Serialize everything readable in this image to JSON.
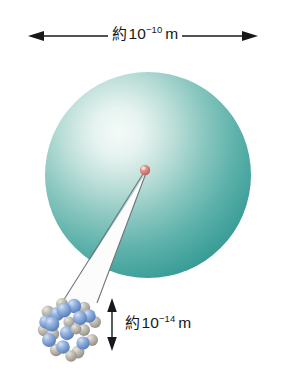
{
  "figure": {
    "type": "scale-diagram",
    "background_color": "#ffffff"
  },
  "annotations": {
    "atom_size": {
      "prefix": "約",
      "mantissa": "10",
      "exponent": "−10",
      "unit": "m",
      "full_text": "約 10⁻¹⁰ m",
      "measures": "atom-diameter",
      "arrow": "double-headed-horizontal"
    },
    "nucleus_size": {
      "prefix": "約",
      "mantissa": "10",
      "exponent": "−14",
      "unit": "m",
      "full_text": "約 10⁻¹⁴ m",
      "measures": "nucleus-diameter",
      "arrow": "double-headed-vertical"
    }
  },
  "shapes": {
    "electron_cloud": {
      "name": "electron-cloud-sphere",
      "center_x": 148,
      "center_y": 175,
      "radius": 103,
      "edge_color": "#2f918d",
      "mid_color": "#5fb4ae",
      "highlight_color": "#eef7f5",
      "highlight_x": 105,
      "highlight_y": 118
    },
    "nucleus_point": {
      "name": "nucleus-point",
      "center_x": 145,
      "center_y": 170,
      "radius": 5,
      "color": "#cf7671",
      "highlight_color": "#f2c4bd"
    },
    "magnifier_cone": {
      "name": "magnification-cone",
      "fill": "#fbfbfb",
      "stroke": "#6e7276",
      "apex_x": 145,
      "apex_y": 172,
      "base_left_x": 52,
      "base_left_y": 316,
      "base_right_x": 96,
      "base_right_y": 304
    },
    "nucleon_cluster": {
      "name": "nucleon-cluster",
      "center_x": 70,
      "center_y": 325,
      "radius": 30,
      "proton_color": "#7fa0d6",
      "proton_highlight": "#c3d4ee",
      "proton_shadow": "#5878ae",
      "neutron_color": "#b9b4ab",
      "neutron_highlight": "#e0dcd4",
      "neutron_shadow": "#8d887f",
      "nucleon_count": 24
    },
    "arrow_horizontal": {
      "name": "atom-size-arrow",
      "x1": 30,
      "x2": 256,
      "y": 36,
      "color": "#16181a"
    },
    "arrow_vertical": {
      "name": "nucleus-size-arrow",
      "x": 112,
      "y1": 299,
      "y2": 350,
      "color": "#16181a"
    }
  },
  "colors": {
    "teal_edge": "#2f918d",
    "teal_mid": "#55aea8",
    "teal_light": "#eef7f5",
    "nucleus_red": "#cf7671",
    "proton_blue": "#7fa0d6",
    "neutron_gray": "#b9b4ab",
    "ink": "#16181a"
  }
}
